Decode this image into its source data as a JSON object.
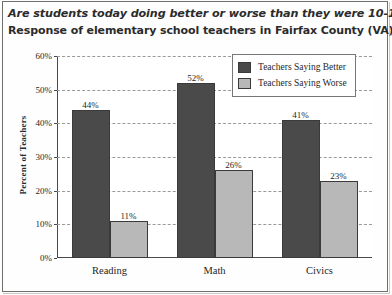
{
  "chart_data": {
    "type": "bar",
    "title": "Are students today doing better or worse than they were 10-15 years ago?",
    "subtitle": "Response of elementary school teachers in Fairfax County (VA), 1999",
    "xlabel": "",
    "ylabel": "Percent of Teachers",
    "categories": [
      "Reading",
      "Math",
      "Civics"
    ],
    "series": [
      {
        "name": "Teachers Saying Better",
        "color": "#4a4a4a",
        "values": [
          44,
          52,
          41
        ],
        "labels": [
          "44%",
          "52%",
          "41%"
        ]
      },
      {
        "name": "Teachers Saying Worse",
        "color": "#b8b8b8",
        "values": [
          11,
          26,
          23
        ],
        "labels": [
          "11%",
          "26%",
          "23%"
        ]
      }
    ],
    "ylim": [
      0,
      60
    ],
    "yticks": [
      0,
      10,
      20,
      30,
      40,
      50,
      60
    ],
    "ytick_labels": [
      "0%",
      "10%",
      "20%",
      "30%",
      "40%",
      "50%",
      "60%"
    ],
    "grid": true,
    "legend_position": "top-right"
  }
}
